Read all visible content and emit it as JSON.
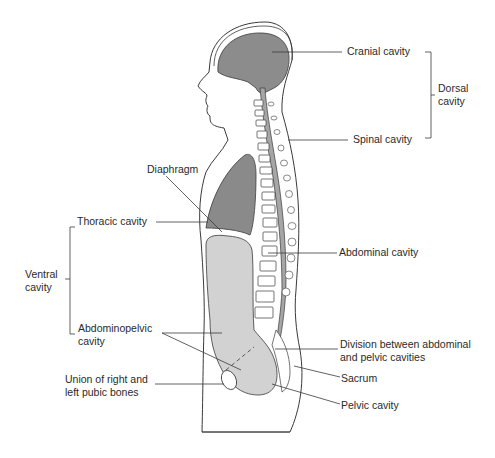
{
  "diagram": {
    "colors": {
      "dorsal_fill": "#8c8c8c",
      "thoracic_fill": "#8a8a8a",
      "abdominopelvic_fill": "#d2d2d2",
      "outline": "#3a3a3a",
      "label_text": "#2a2a2a"
    },
    "labels": {
      "cranial": "Cranial cavity",
      "dorsal_1": "Dorsal",
      "dorsal_2": "cavity",
      "spinal": "Spinal cavity",
      "diaphragm": "Diaphragm",
      "thoracic": "Thoracic cavity",
      "abdominal": "Abdominal cavity",
      "ventral_1": "Ventral",
      "ventral_2": "cavity",
      "abdominopelvic_1": "Abdominopelvic",
      "abdominopelvic_2": "cavity",
      "division_1": "Division between abdominal",
      "division_2": "and pelvic cavities",
      "sacrum": "Sacrum",
      "pubic_1": "Union of right and",
      "pubic_2": "left pubic bones",
      "pelvic": "Pelvic cavity"
    }
  }
}
